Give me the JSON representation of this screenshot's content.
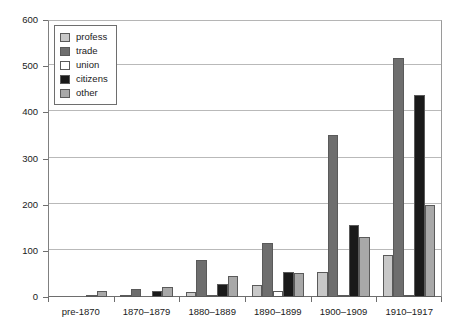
{
  "chart_data": {
    "type": "bar",
    "title": "",
    "xlabel": "",
    "ylabel": "",
    "ylim": [
      0,
      600
    ],
    "y_ticks": [
      0,
      100,
      200,
      300,
      400,
      500,
      600
    ],
    "grid": true,
    "legend_position": "top-left",
    "categories": [
      "pre-1870",
      "1870–1879",
      "1880–1889",
      "1890–1899",
      "1900–1909",
      "1910–1917"
    ],
    "series": [
      {
        "name": "profess",
        "color": "#c8c8c8",
        "values": [
          0,
          4,
          10,
          25,
          55,
          92
        ]
      },
      {
        "name": "trade",
        "color": "#6e6e6e",
        "values": [
          0,
          18,
          80,
          118,
          350,
          518
        ]
      },
      {
        "name": "union",
        "color": "#ffffff",
        "values": [
          0,
          0,
          5,
          12,
          3,
          3
        ]
      },
      {
        "name": "citizens",
        "color": "#1a1a1a",
        "values": [
          4,
          13,
          28,
          55,
          155,
          437
        ]
      },
      {
        "name": "other",
        "color": "#a8a8a8",
        "values": [
          13,
          22,
          45,
          52,
          130,
          200
        ]
      }
    ]
  },
  "legend": {
    "items": [
      {
        "label": "profess"
      },
      {
        "label": "trade"
      },
      {
        "label": "union"
      },
      {
        "label": "citizens"
      },
      {
        "label": "other"
      }
    ]
  },
  "axis": {
    "y_tick_labels": [
      "0",
      "100",
      "200",
      "300",
      "400",
      "500",
      "600"
    ],
    "x_tick_labels": [
      "pre-1870",
      "1870–1879",
      "1880–1889",
      "1890–1899",
      "1900–1909",
      "1910–1917"
    ]
  },
  "colors": {
    "profess": "#c8c8c8",
    "trade": "#6e6e6e",
    "union": "#ffffff",
    "citizens": "#1a1a1a",
    "other": "#a8a8a8",
    "grid": "#b9b9b9",
    "axis": "#6e6e6e",
    "text": "#1a1a1a"
  }
}
